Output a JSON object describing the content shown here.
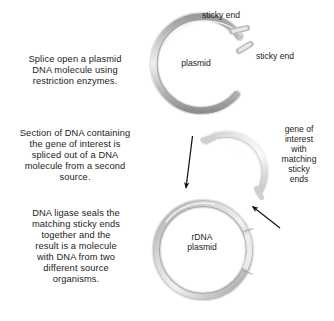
{
  "figure": {
    "background_color": "#ffffff",
    "text_color": "#1c1c1c",
    "dna_color_light": "#e8e8e8",
    "dna_color_mid": "#b5b5b5",
    "dna_color_dark": "#8a8a8a",
    "arrow_color": "#1a1a1a"
  },
  "steps": [
    {
      "id": "step-1",
      "text": "Splice open a plasmid\nDNA molecule using\nrestriction enzymes."
    },
    {
      "id": "step-2",
      "text": "Section of DNA containing\nthe gene of interest is\nspliced out of a DNA\nmolecule from a second\nsource."
    },
    {
      "id": "step-3",
      "text": "DNA ligase seals the\nmatching sticky ends\ntogether and the\nresult is a molecule\nwith DNA from two\ndifferent source\norganisms."
    }
  ],
  "labels": {
    "sticky_end_top": "sticky end",
    "sticky_end_right": "sticky end",
    "plasmid": "plasmid",
    "gene_of_interest": "gene of\ninterest\nwith\nmatching\nsticky\nends",
    "rdna_plasmid": "rDNA\nplasmid"
  },
  "diagram_elements": {
    "open_plasmid": {
      "name": "open-plasmid-ring",
      "shape": "C-shaped open circular DNA with a gap at the 1-2 o'clock position",
      "center": [
        205,
        68
      ],
      "radius": 47,
      "gap_sticky_ends": 2
    },
    "dna_fragment": {
      "name": "dna-fragment-arc",
      "shape": "short light-gray arc representing the excised gene of interest with matching sticky ends",
      "center": [
        230,
        168
      ],
      "radius": 38
    },
    "rdna_plasmid": {
      "name": "rdna-plasmid-ring",
      "shape": "closed circular recombinant DNA plasmid with a visible insert seam on the right side",
      "center": [
        203,
        250
      ],
      "radius": 46
    },
    "arrows": [
      {
        "name": "arrow-plasmid-to-rdna",
        "from": [
          192,
          137
        ],
        "to": [
          186,
          190
        ],
        "direction": "down"
      },
      {
        "name": "arrow-fragment-to-rdna",
        "from": [
          278,
          226
        ],
        "to": [
          251,
          205
        ],
        "direction": "down-left"
      }
    ]
  }
}
